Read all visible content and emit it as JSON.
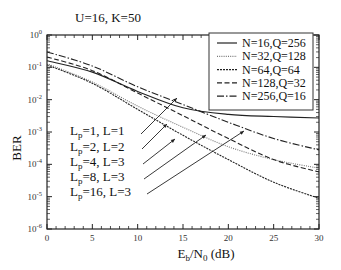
{
  "chart_data": {
    "type": "line",
    "title": "U=16, K=50",
    "xlabel": "E_b/N_0 (dB)",
    "xlabel_parts": {
      "main": "E",
      "sub1": "b",
      "mid": "/N",
      "sub2": "0",
      "tail": " (dB)"
    },
    "ylabel": "BER",
    "x_scale": "linear",
    "y_scale": "log",
    "xlim": [
      0,
      30
    ],
    "ylim": [
      1e-06,
      1
    ],
    "x_ticks": [
      0,
      5,
      10,
      15,
      20,
      25,
      30
    ],
    "x_tick_labels": [
      "0",
      "5",
      "10",
      "15",
      "20",
      "25",
      "30"
    ],
    "y_ticks_exp": [
      0,
      -1,
      -2,
      -3,
      -4,
      -5,
      -6
    ],
    "y_tick_labels": [
      "10^0",
      "10^-1",
      "10^-2",
      "10^-3",
      "10^-4",
      "10^-5",
      "10^-6"
    ],
    "grid": false,
    "legend_position": "upper right",
    "x": [
      0,
      5,
      10,
      15,
      20,
      25,
      30
    ],
    "series": [
      {
        "name": "N=16,Q=256",
        "style": "solid",
        "values": [
          0.16,
          0.071,
          0.018,
          0.0056,
          0.0035,
          0.003,
          0.0027
        ]
      },
      {
        "name": "N=32,Q=128",
        "style": "dotted",
        "values": [
          0.13,
          0.035,
          0.0063,
          0.0014,
          0.00035,
          0.00014,
          7.6e-05
        ]
      },
      {
        "name": "N=64,Q=64",
        "style": "dense-dashed",
        "values": [
          0.12,
          0.032,
          0.005,
          0.00079,
          0.00014,
          2.8e-05,
          8.9e-06
        ]
      },
      {
        "name": "N=128,Q=32",
        "style": "dashed",
        "values": [
          0.21,
          0.079,
          0.016,
          0.0032,
          0.00063,
          0.00014,
          5.8e-05
        ]
      },
      {
        "name": "N=256,Q=16",
        "style": "dash-dot",
        "values": [
          0.3,
          0.11,
          0.025,
          0.0071,
          0.002,
          0.00063,
          0.00028
        ]
      }
    ],
    "annotations": [
      {
        "text_main": "L",
        "text_sub": "p",
        "text_rest": "=1, L=1",
        "label": "Lp=1, L=1"
      },
      {
        "text_main": "L",
        "text_sub": "p",
        "text_rest": "=2, L=2",
        "label": "Lp=2, L=2"
      },
      {
        "text_main": "L",
        "text_sub": "p",
        "text_rest": "=4, L=3",
        "label": "Lp=4, L=3"
      },
      {
        "text_main": "L",
        "text_sub": "p",
        "text_rest": "=8, L=3",
        "label": "Lp=8, L=3"
      },
      {
        "text_main": "L",
        "text_sub": "p",
        "text_rest": "=16, L=3",
        "label": "Lp=16, L=3"
      }
    ]
  }
}
